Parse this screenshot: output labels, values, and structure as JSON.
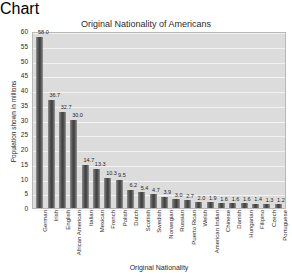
{
  "chart_data": {
    "type": "bar",
    "title": "Original Nationality of Americans",
    "xlabel": "Original Nationality",
    "ylabel": "Population shown in millions",
    "ylim": [
      0,
      60
    ],
    "yticks": [
      0,
      5,
      10,
      15,
      20,
      25,
      30,
      35,
      40,
      45,
      50,
      55,
      60
    ],
    "grid": true,
    "legend": "none",
    "categories": [
      "German",
      "Irish",
      "English",
      "African American",
      "Italian",
      "Mexican",
      "French",
      "Polish",
      "Dutch",
      "Scottish",
      "Swedish",
      "Norwegian",
      "Russian",
      "Puerto Rican",
      "Welsh",
      "American Indian",
      "Chinese",
      "Danish",
      "Hungarian",
      "Filipino",
      "Czech",
      "Portuguese"
    ],
    "values": [
      58.0,
      36.7,
      32.7,
      30.0,
      14.7,
      13.3,
      10.3,
      9.5,
      6.2,
      5.4,
      4.7,
      3.9,
      3.0,
      2.7,
      2.0,
      1.9,
      1.6,
      1.6,
      1.6,
      1.4,
      1.3,
      1.2
    ],
    "value_labels": [
      "58.0",
      "36.7",
      "32.7",
      "30.0",
      "14.7",
      "13.3",
      "10.3",
      "9.5",
      "6.2",
      "5.4",
      "4.7",
      "3.9",
      "3.0",
      "2.7",
      "2.0",
      "1.9",
      "1.6",
      "1.6",
      "1.6",
      "1.4",
      "1.3",
      "1.2"
    ],
    "colors": {
      "bar_dark": "#3d3d3d",
      "bar_light": "#9a9a9a",
      "plot_background": "#dcdcdc",
      "gridline": "#f2f2f2",
      "frame": "#b8b8b8",
      "text": "#2b2b2b",
      "page_background": "#ffffff"
    }
  }
}
